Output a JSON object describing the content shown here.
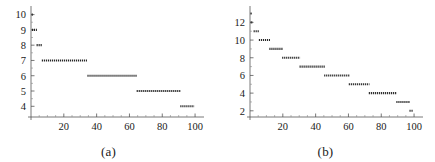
{
  "figure": {
    "panels": [
      {
        "caption": "(a)",
        "name": "panel-a"
      },
      {
        "caption": "(b)",
        "name": "panel-b"
      }
    ]
  },
  "chart_data": [
    {
      "type": "line",
      "title": "",
      "subtitle": "(a)",
      "xlabel": "",
      "ylabel": "",
      "xlim": [
        0,
        103
      ],
      "ylim": [
        3.3,
        10.3
      ],
      "grid": false,
      "legend": null,
      "xticks": [
        20,
        40,
        60,
        80,
        100
      ],
      "xticklabels": [
        "20",
        "40",
        "60",
        "80",
        "100"
      ],
      "xminorticks": [
        5,
        10,
        15,
        25,
        30,
        35,
        45,
        50,
        55,
        65,
        70,
        75,
        85,
        90,
        95
      ],
      "yticks": [
        4,
        5,
        6,
        7,
        8,
        9,
        10
      ],
      "yticklabels": [
        "4",
        "5",
        "6",
        "7",
        "8",
        "9",
        "10"
      ],
      "yminorticks": [
        4.5,
        5.5,
        6.5,
        7.5,
        8.5,
        9.5
      ],
      "description": "Piecewise-constant decreasing step function drawn as dotted horizontal segments",
      "segments": [
        {
          "y": 10,
          "x_start": 0.4,
          "x_end": 1.6
        },
        {
          "y": 9,
          "x_start": 0.6,
          "x_end": 3.6
        },
        {
          "y": 8,
          "x_start": 3.4,
          "x_end": 7.0
        },
        {
          "y": 7,
          "x_start": 6.6,
          "x_end": 34.6
        },
        {
          "y": 6,
          "x_start": 34.4,
          "x_end": 64.6
        },
        {
          "y": 5,
          "x_start": 64.4,
          "x_end": 91.4
        },
        {
          "y": 4,
          "x_start": 91.0,
          "x_end": 99.6
        }
      ]
    },
    {
      "type": "line",
      "title": "",
      "subtitle": "(b)",
      "xlabel": "",
      "ylabel": "",
      "xlim": [
        0,
        103
      ],
      "ylim": [
        1.3,
        13.4
      ],
      "grid": false,
      "legend": null,
      "xticks": [
        20,
        40,
        60,
        80,
        100
      ],
      "xticklabels": [
        "20",
        "40",
        "60",
        "80",
        "100"
      ],
      "xminorticks": [
        5,
        10,
        15,
        25,
        30,
        35,
        45,
        50,
        55,
        65,
        70,
        75,
        85,
        90,
        95
      ],
      "yticks": [
        2,
        4,
        6,
        8,
        10,
        12
      ],
      "yticklabels": [
        "2",
        "4",
        "6",
        "8",
        "10",
        "12"
      ],
      "yminorticks": [
        3,
        5,
        7,
        9,
        11,
        13
      ],
      "description": "Piecewise-constant decreasing step function drawn as dotted horizontal segments",
      "segments": [
        {
          "y": 13,
          "x_start": 0.3,
          "x_end": 1.4
        },
        {
          "y": 12,
          "x_start": 0.4,
          "x_end": 1.8
        },
        {
          "y": 11,
          "x_start": 2.2,
          "x_end": 5.6
        },
        {
          "y": 10,
          "x_start": 5.4,
          "x_end": 12.2
        },
        {
          "y": 9,
          "x_start": 11.8,
          "x_end": 20.0
        },
        {
          "y": 8,
          "x_start": 19.6,
          "x_end": 30.6
        },
        {
          "y": 7,
          "x_start": 30.2,
          "x_end": 45.6
        },
        {
          "y": 6,
          "x_start": 45.2,
          "x_end": 60.6
        },
        {
          "y": 5,
          "x_start": 60.2,
          "x_end": 72.8
        },
        {
          "y": 4,
          "x_start": 72.4,
          "x_end": 89.6
        },
        {
          "y": 3,
          "x_start": 89.2,
          "x_end": 97.4
        },
        {
          "y": 2,
          "x_start": 97.2,
          "x_end": 99.4
        }
      ]
    }
  ]
}
